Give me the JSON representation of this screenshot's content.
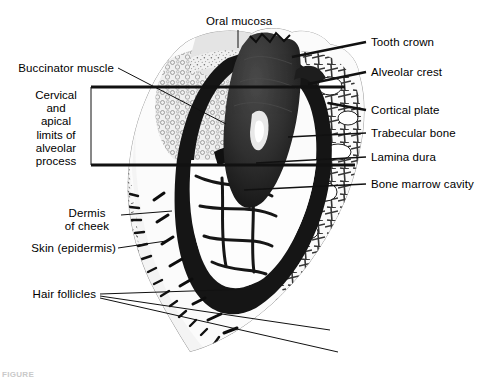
{
  "figure": {
    "type": "histology-micrograph",
    "caption_partial": "FIGURE",
    "colors": {
      "background": "#ffffff",
      "ink": "#000000",
      "tissue_light": "#ececec",
      "tissue_mid": "#b9b9b9",
      "tissue_dark": "#6d6d6d",
      "bone_dark": "#1b1b1b",
      "tooth_dark": "#262626",
      "leader_line": "#1a1a1a"
    }
  },
  "labels": {
    "oral_mucosa": "Oral mucosa",
    "tooth_crown": "Tooth crown",
    "alveolar_crest": "Alveolar crest",
    "cortical_plate": "Cortical plate",
    "trabecular_bone": "Trabecular bone",
    "lamina_dura": "Lamina dura",
    "bone_marrow_cavity": "Bone marrow cavity",
    "buccinator_muscle": "Buccinator muscle",
    "dermis_line1": "Dermis",
    "dermis_line2": "of cheek",
    "skin_epidermis": "Skin (epidermis)",
    "hair_follicles": "Hair follicles",
    "bracket": {
      "line1": "Cervical",
      "line2": "and",
      "line3": "apical",
      "line4": "limits of",
      "line5": "alveolar",
      "line6": "process"
    }
  }
}
